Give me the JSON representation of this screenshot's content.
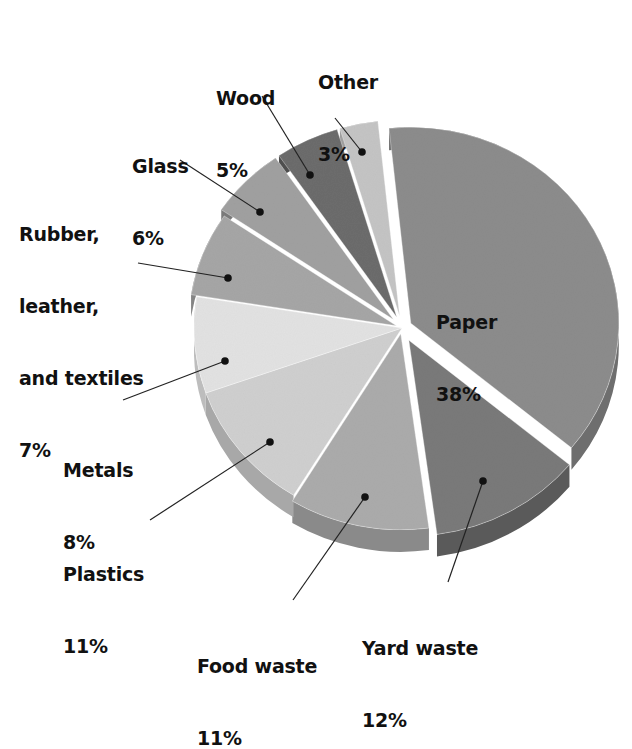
{
  "chart_data": {
    "type": "pie",
    "title": "",
    "style": "3d-exploded",
    "start_angle_deg": -6,
    "direction": "clockwise",
    "slices": [
      {
        "label": "Paper",
        "value": 38,
        "display": "38%",
        "color": "#8c8c8c",
        "side": "#6e6e6e",
        "explode": 10
      },
      {
        "label": "Yard waste",
        "value": 12,
        "display": "12%",
        "color": "#7a7a7a",
        "side": "#5a5a5a",
        "explode": 14
      },
      {
        "label": "Food waste",
        "value": 11,
        "display": "11%",
        "color": "#ababab",
        "side": "#8a8a8a",
        "explode": 6
      },
      {
        "label": "Plastics",
        "value": 11,
        "display": "11%",
        "color": "#cfcfcf",
        "side": "#a8a8a8",
        "explode": 0
      },
      {
        "label": "Metals",
        "value": 8,
        "display": "8%",
        "color": "#e2e2e2",
        "side": "#bdbdbd",
        "explode": 0
      },
      {
        "label": "Rubber, leather, and textiles",
        "value": 7,
        "display": "7%",
        "color": "#a6a6a6",
        "side": "#858585",
        "explode": 6
      },
      {
        "label": "Glass",
        "value": 6,
        "display": "6%",
        "color": "#a0a0a0",
        "side": "#7a7a7a",
        "explode": 12
      },
      {
        "label": "Wood",
        "value": 5,
        "display": "5%",
        "color": "#6c6c6c",
        "side": "#4e4e4e",
        "explode": 12
      },
      {
        "label": "Other",
        "value": 3,
        "display": "3%",
        "color": "#c4c4c4",
        "side": "#9e9e9e",
        "explode": 12
      }
    ]
  },
  "labels": {
    "paper": {
      "name": "Paper",
      "pct": "38%"
    },
    "yard": {
      "name": "Yard waste",
      "pct": "12%"
    },
    "food": {
      "name": "Food waste",
      "pct": "11%"
    },
    "plastics": {
      "name": "Plastics",
      "pct": "11%"
    },
    "metals": {
      "name": "Metals",
      "pct": "8%"
    },
    "rubber": {
      "line1": "Rubber,",
      "line2": "leather,",
      "line3": "and textiles",
      "pct": "7%"
    },
    "glass": {
      "name": "Glass",
      "pct": "6%"
    },
    "wood": {
      "name": "Wood",
      "pct": "5%"
    },
    "other": {
      "name": "Other",
      "pct": "3%"
    }
  },
  "leaders": [
    {
      "from": [
        335,
        118
      ],
      "to": [
        362,
        152
      ]
    },
    {
      "from": [
        262,
        96
      ],
      "to": [
        310,
        175
      ]
    },
    {
      "from": [
        180,
        160
      ],
      "to": [
        260,
        212
      ]
    },
    {
      "from": [
        138,
        263
      ],
      "to": [
        228,
        278
      ]
    },
    {
      "from": [
        123,
        400
      ],
      "to": [
        225,
        361
      ]
    },
    {
      "from": [
        150,
        520
      ],
      "to": [
        270,
        442
      ]
    },
    {
      "from": [
        293,
        600
      ],
      "to": [
        365,
        497
      ]
    },
    {
      "from": [
        448,
        582
      ],
      "to": [
        483,
        481
      ]
    }
  ]
}
